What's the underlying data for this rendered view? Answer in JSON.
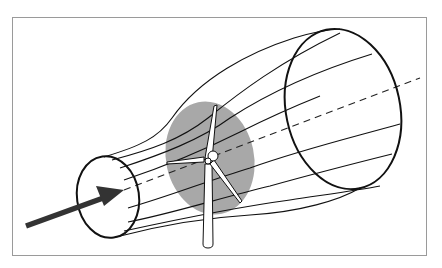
{
  "diagram": {
    "type": "wind-turbine-stream-tube",
    "colors": {
      "background": "#ffffff",
      "frame": "#9a9a9a",
      "line": "#111111",
      "rotor_disk": "#a8a8a8",
      "arrow": "#333333",
      "turbine_fill": "#ffffff"
    },
    "elements": {
      "wind_arrow": {
        "from": [
          26,
          226
        ],
        "to": [
          124,
          190
        ]
      },
      "upstream_section": {
        "cx": 108,
        "cy": 197,
        "rx": 31,
        "ry": 41,
        "rotate": -8
      },
      "rotor_disk": {
        "cx": 210,
        "cy": 158,
        "rx": 44,
        "ry": 57,
        "rotate": -12
      },
      "downstream_section": {
        "cx": 343,
        "cy": 109,
        "rx": 57,
        "ry": 81,
        "rotate": -12
      },
      "centerline_dashed": {
        "from": [
          124,
          190
        ],
        "to": [
          420,
          78
        ]
      },
      "turbine": {
        "hub": [
          208,
          161
        ],
        "tower_base_y": 247
      }
    }
  }
}
